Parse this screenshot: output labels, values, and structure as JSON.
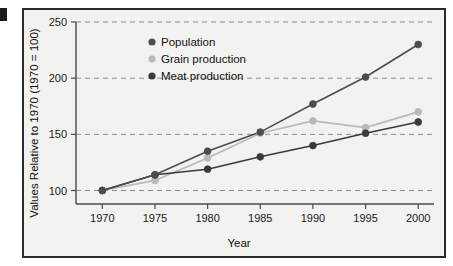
{
  "figure": {
    "background_color": "#f2f2f0",
    "frame_color": "#2a2a2a",
    "edge_fragment_present": true
  },
  "chart_data": {
    "type": "line",
    "title": "",
    "xlabel": "Year",
    "ylabel": "Values Relative to 1970 (1970 = 100)",
    "x": [
      1970,
      1975,
      1980,
      1985,
      1990,
      1995,
      2000
    ],
    "xtick_labels": [
      "1970",
      "1975",
      "1980",
      "1985",
      "1990",
      "1995",
      "2000"
    ],
    "ytick_labels": [
      "100",
      "150",
      "200",
      "250"
    ],
    "yticks": [
      100,
      150,
      200,
      250
    ],
    "ylim": [
      88,
      250
    ],
    "xlim": [
      1967.5,
      2001.5
    ],
    "grid": true,
    "grid_style": "dashed-horizontal",
    "legend_position": "top-left-inside",
    "series": [
      {
        "name": "Population",
        "color": "#4d4d4d",
        "marker": "circle",
        "values": [
          100,
          114,
          135,
          152,
          177,
          201,
          230
        ]
      },
      {
        "name": "Grain production",
        "color": "#b9b9b9",
        "marker": "circle",
        "values": [
          100,
          109,
          129,
          151,
          162,
          156,
          170
        ]
      },
      {
        "name": "Meat production",
        "color": "#3a3a3a",
        "marker": "circle",
        "values": [
          100,
          114,
          119,
          130,
          140,
          151,
          161
        ]
      }
    ]
  },
  "legend": {
    "items": [
      {
        "label": "Population",
        "swatch_color": "#4d4d4d"
      },
      {
        "label": "Grain production",
        "swatch_color": "#b9b9b9"
      },
      {
        "label": "Meat production",
        "swatch_color": "#3a3a3a"
      }
    ]
  }
}
